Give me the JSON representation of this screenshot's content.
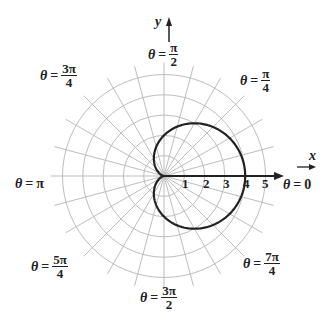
{
  "chart_data": {
    "type": "polar-curve",
    "title": "",
    "curve": {
      "equation": "r = 2 + 2cos(theta)",
      "max_r": 4,
      "color": "#222222"
    },
    "grid": {
      "rings": [
        1,
        2,
        3,
        4,
        5
      ],
      "spoke_step_deg": 15,
      "color": "#bdbdbd"
    },
    "r_tick_labels": [
      "1",
      "2",
      "3",
      "4",
      "5"
    ],
    "axes": {
      "x_label": "x",
      "y_label": "y"
    },
    "angle_labels": [
      {
        "theta": "θ",
        "eq": "=",
        "value": "0",
        "fraction": false
      },
      {
        "theta": "θ",
        "eq": "=",
        "num": "π",
        "den": "4",
        "fraction": true
      },
      {
        "theta": "θ",
        "eq": "=",
        "num": "π",
        "den": "2",
        "fraction": true
      },
      {
        "theta": "θ",
        "eq": "=",
        "num": "3π",
        "den": "4",
        "fraction": true
      },
      {
        "theta": "θ",
        "eq": "=",
        "value": "π",
        "fraction": false
      },
      {
        "theta": "θ",
        "eq": "=",
        "num": "5π",
        "den": "4",
        "fraction": true
      },
      {
        "theta": "θ",
        "eq": "=",
        "num": "3π",
        "den": "2",
        "fraction": true
      },
      {
        "theta": "θ",
        "eq": "=",
        "num": "7π",
        "den": "4",
        "fraction": true
      }
    ]
  }
}
